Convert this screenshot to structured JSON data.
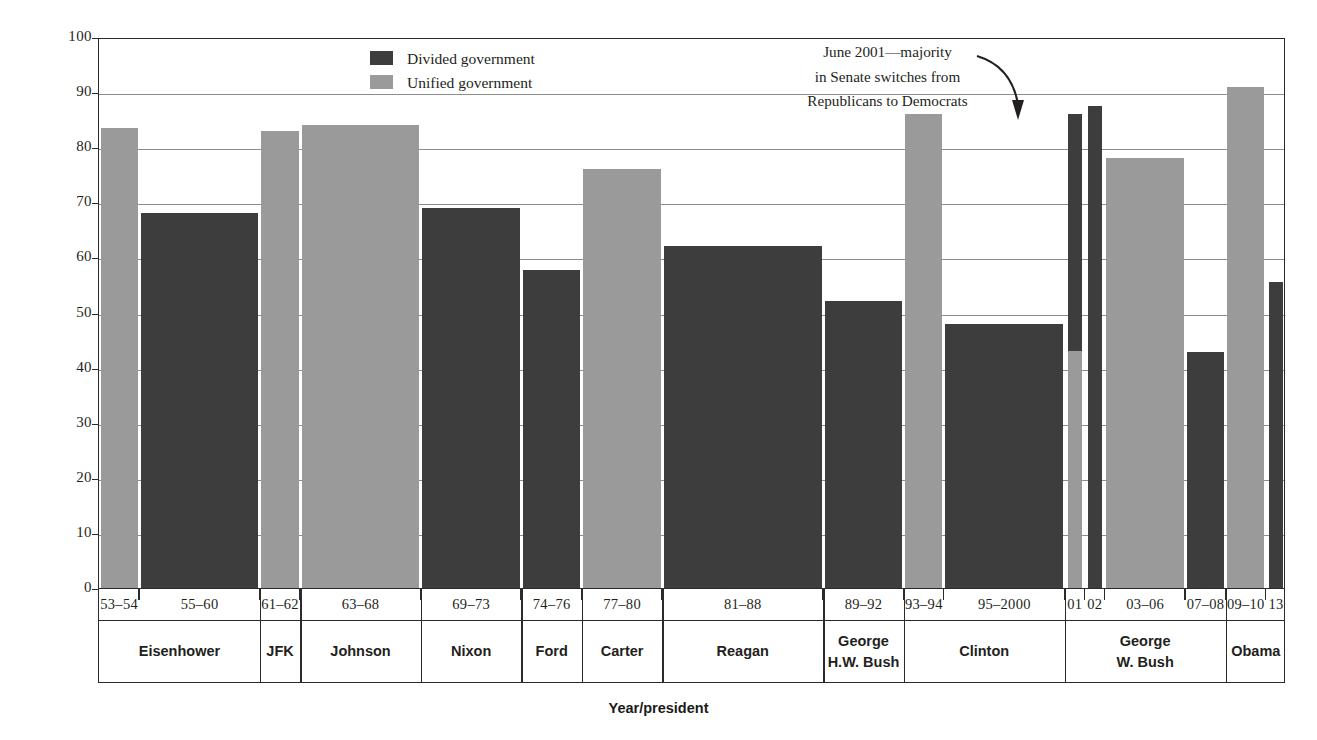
{
  "chart_data": {
    "type": "bar",
    "title": "",
    "xlabel": "Year/president",
    "ylabel": "Percentage of presidents’ bills passed",
    "ylim": [
      0,
      100
    ],
    "yticks": [
      0,
      10,
      20,
      30,
      40,
      50,
      60,
      70,
      80,
      90,
      100
    ],
    "grid": true,
    "legend_position": "top-center",
    "legend": [
      {
        "key": "divided",
        "label": "Divided government",
        "color": "#3d3d3d"
      },
      {
        "key": "unified",
        "label": "Unified government",
        "color": "#9a9a9a"
      }
    ],
    "annotations": [
      {
        "name": "june-2001-senate-switch",
        "lines": [
          "June 2001—majority",
          "in Senate switches from",
          "Republicans to Democrats"
        ],
        "points_to": "01"
      }
    ],
    "categories": [
      "53–54",
      "55–60",
      "61–62",
      "63–68",
      "69–73",
      "74–76",
      "77–80",
      "81–88",
      "89–92",
      "93–94",
      "95–2000",
      "01",
      "02",
      "03–06",
      "07–08",
      "09–10",
      "13"
    ],
    "bars": [
      {
        "period": "53–54",
        "president": "Eisenhower",
        "value": 83.5,
        "government": "unified",
        "span": 2
      },
      {
        "period": "55–60",
        "president": "Eisenhower",
        "value": 68.0,
        "government": "divided",
        "span": 6
      },
      {
        "period": "61–62",
        "president": "JFK",
        "value": 83.0,
        "government": "unified",
        "span": 2
      },
      {
        "period": "63–68",
        "president": "Johnson",
        "value": 84.0,
        "government": "unified",
        "span": 6
      },
      {
        "period": "69–73",
        "president": "Nixon",
        "value": 69.0,
        "government": "divided",
        "span": 5
      },
      {
        "period": "74–76",
        "president": "Ford",
        "value": 57.8,
        "government": "divided",
        "span": 3
      },
      {
        "period": "77–80",
        "president": "Carter",
        "value": 76.0,
        "government": "unified",
        "span": 4
      },
      {
        "period": "81–88",
        "president": "Reagan",
        "value": 62.0,
        "government": "divided",
        "span": 8
      },
      {
        "period": "89–92",
        "president": "George H.W. Bush",
        "value": 52.0,
        "government": "divided",
        "span": 4
      },
      {
        "period": "93–94",
        "president": "Clinton",
        "value": 86.0,
        "government": "unified",
        "span": 2
      },
      {
        "period": "95–2000",
        "president": "Clinton",
        "value": 48.0,
        "government": "divided",
        "span": 6
      },
      {
        "period": "01",
        "president": "George W. Bush",
        "value": 86.0,
        "government": "split",
        "segments": [
          {
            "government": "unified",
            "from": 0,
            "to": 43
          },
          {
            "government": "divided",
            "from": 43,
            "to": 86
          }
        ],
        "span": 1
      },
      {
        "period": "02",
        "president": "George W. Bush",
        "value": 87.5,
        "government": "divided",
        "span": 1
      },
      {
        "period": "03–06",
        "president": "George W. Bush",
        "value": 78.0,
        "government": "unified",
        "span": 4
      },
      {
        "period": "07–08",
        "president": "George W. Bush",
        "value": 42.8,
        "government": "divided",
        "span": 2
      },
      {
        "period": "09–10",
        "president": "Obama",
        "value": 91.0,
        "government": "unified",
        "span": 2
      },
      {
        "period": "13",
        "president": "Obama",
        "value": 55.5,
        "government": "divided",
        "span": 1
      }
    ],
    "president_groups": [
      {
        "label_lines": [
          "Eisenhower"
        ],
        "periods": [
          "53–54",
          "55–60"
        ]
      },
      {
        "label_lines": [
          "JFK"
        ],
        "periods": [
          "61–62"
        ]
      },
      {
        "label_lines": [
          "Johnson"
        ],
        "periods": [
          "63–68"
        ]
      },
      {
        "label_lines": [
          "Nixon"
        ],
        "periods": [
          "69–73"
        ]
      },
      {
        "label_lines": [
          "Ford"
        ],
        "periods": [
          "74–76"
        ]
      },
      {
        "label_lines": [
          "Carter"
        ],
        "periods": [
          "77–80"
        ]
      },
      {
        "label_lines": [
          "Reagan"
        ],
        "periods": [
          "81–88"
        ]
      },
      {
        "label_lines": [
          "George",
          "H.W. Bush"
        ],
        "periods": [
          "89–92"
        ]
      },
      {
        "label_lines": [
          "Clinton"
        ],
        "periods": [
          "93–94",
          "95–2000"
        ]
      },
      {
        "label_lines": [
          "George",
          "W. Bush"
        ],
        "periods": [
          "01",
          "02",
          "03–06",
          "07–08"
        ]
      },
      {
        "label_lines": [
          "Obama"
        ],
        "periods": [
          "09–10",
          "13"
        ]
      }
    ]
  },
  "colors": {
    "divided": "#3d3d3d",
    "unified": "#9a9a9a",
    "axis": "#2b2b2b",
    "grid": "#8d8d8d",
    "text": "#231f20"
  }
}
